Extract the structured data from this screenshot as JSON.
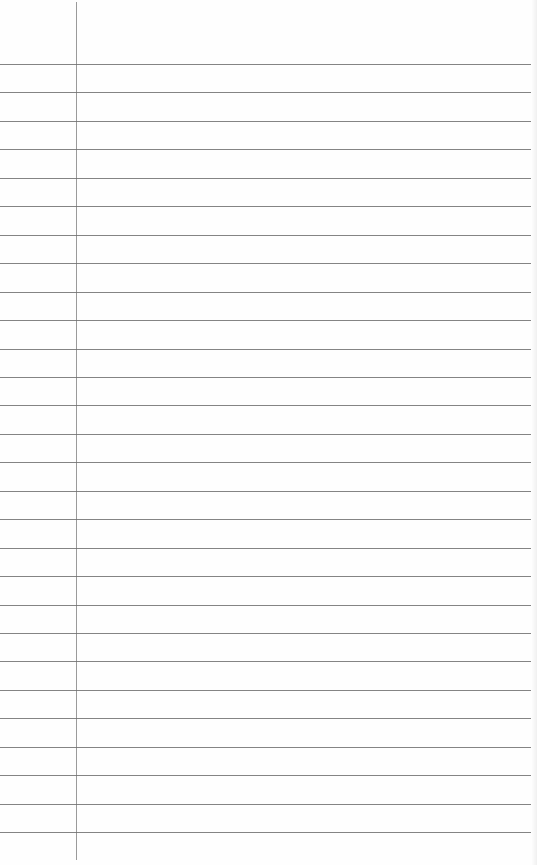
{
  "page": {
    "type": "lined-notebook-paper",
    "background_color": "#fefefe",
    "rule_color": "#6e6e6e",
    "margin_color": "#9a9a9a",
    "margin_x": 76,
    "rule_start_y": 64,
    "rule_spacing": 28.45,
    "rule_count": 28,
    "rule_width": 532,
    "content": ""
  }
}
